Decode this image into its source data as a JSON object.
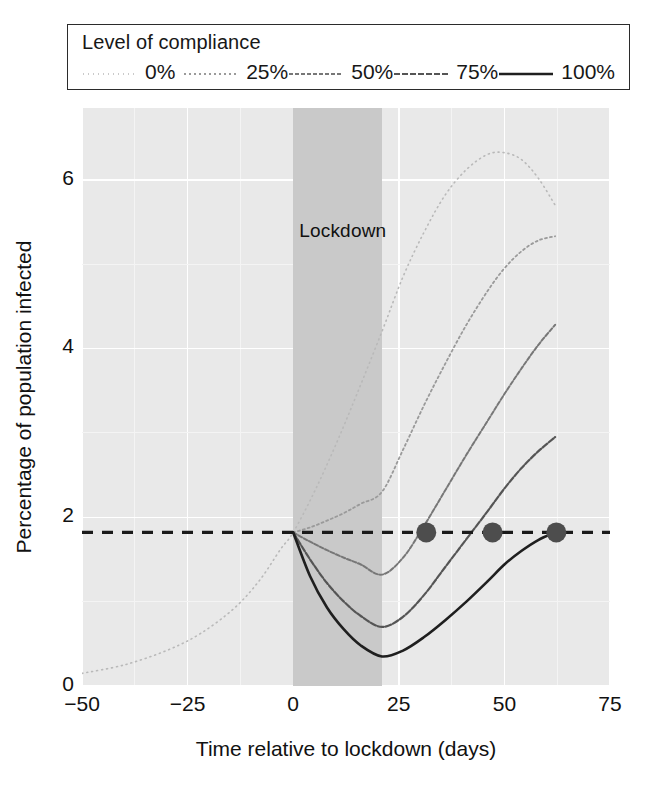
{
  "legend": {
    "title": "Level of compliance",
    "items": [
      {
        "label": "0%",
        "style": "dotted-light",
        "color": "#b9b9b9",
        "dash": "1,4",
        "width": 1.6
      },
      {
        "label": "25%",
        "style": "dotted",
        "color": "#9a9a9a",
        "dash": "2,3",
        "width": 1.8
      },
      {
        "label": "50%",
        "style": "dashed-fine",
        "color": "#777777",
        "dash": "4,2",
        "width": 2.0
      },
      {
        "label": "75%",
        "style": "dashed",
        "color": "#555555",
        "dash": "6,2",
        "width": 2.2
      },
      {
        "label": "100%",
        "style": "solid",
        "color": "#1f1f1f",
        "dash": "",
        "width": 2.6
      }
    ]
  },
  "annotations": {
    "lockdown_label": "Lockdown",
    "lockdown_start": 0,
    "lockdown_end": 21,
    "threshold_value": 1.82,
    "threshold_style": "dashed",
    "threshold_color": "#1a1a1a",
    "marker_color": "#4d4d4d",
    "markers": [
      {
        "x": 31.5,
        "y": 1.82
      },
      {
        "x": 47.2,
        "y": 1.82
      },
      {
        "x": 62.3,
        "y": 1.82
      }
    ]
  },
  "colors": {
    "panel": "#e9e9e9",
    "gridline_major": "#ffffff",
    "gridline_minor": "#f4f4f4",
    "lockdown_band": "#c9c9c9",
    "text": "#111111",
    "legend_border": "#2b2b2b"
  },
  "chart_data": {
    "type": "line",
    "title": "",
    "xlabel": "Time relative to lockdown (days)",
    "ylabel": "Percentage of population infected",
    "xlim": [
      -50,
      75
    ],
    "ylim": [
      0,
      6.85
    ],
    "xticks": [
      -50,
      -25,
      0,
      25,
      50,
      75
    ],
    "xtick_labels": [
      "−50",
      "−25",
      "0",
      "25",
      "50",
      "75"
    ],
    "yticks": [
      0,
      2,
      4,
      6
    ],
    "ytick_labels": [
      "0",
      "2",
      "4",
      "6"
    ],
    "grid": true,
    "legend_position": "above-plot",
    "shaded_regions": [
      {
        "label": "Lockdown",
        "x0": 0,
        "x1": 21,
        "color": "#c9c9c9"
      }
    ],
    "reference_lines": [
      {
        "orientation": "horizontal",
        "value": 1.82,
        "style": "dashed",
        "color": "#1a1a1a"
      }
    ],
    "series": [
      {
        "name": "0%",
        "x": [
          -50,
          -40,
          -30,
          -22,
          -14,
          -8,
          -3,
          0,
          5,
          10,
          15,
          21,
          26,
          31,
          36,
          41,
          46,
          50,
          54,
          58,
          62
        ],
        "values": [
          0.15,
          0.25,
          0.42,
          0.62,
          0.92,
          1.25,
          1.62,
          1.82,
          2.3,
          2.85,
          3.45,
          4.2,
          4.85,
          5.38,
          5.82,
          6.12,
          6.3,
          6.32,
          6.24,
          6.02,
          5.7
        ]
      },
      {
        "name": "25%",
        "x": [
          0,
          4,
          8,
          12,
          16,
          21,
          26,
          31,
          36,
          41,
          46,
          50,
          54,
          58,
          62
        ],
        "values": [
          1.82,
          1.88,
          1.96,
          2.05,
          2.16,
          2.3,
          2.8,
          3.33,
          3.82,
          4.28,
          4.68,
          4.95,
          5.15,
          5.28,
          5.33
        ]
      },
      {
        "name": "50%",
        "x": [
          0,
          4,
          8,
          12,
          16,
          21,
          26,
          31,
          36,
          41,
          46,
          50,
          54,
          58,
          62
        ],
        "values": [
          1.82,
          1.71,
          1.61,
          1.52,
          1.44,
          1.32,
          1.52,
          1.9,
          2.32,
          2.74,
          3.14,
          3.46,
          3.76,
          4.04,
          4.28
        ]
      },
      {
        "name": "75%",
        "x": [
          0,
          4,
          8,
          12,
          16,
          21,
          26,
          31,
          36,
          41,
          46,
          50,
          54,
          58,
          62
        ],
        "values": [
          1.82,
          1.5,
          1.22,
          1.0,
          0.83,
          0.7,
          0.82,
          1.08,
          1.41,
          1.74,
          2.07,
          2.34,
          2.58,
          2.78,
          2.95
        ]
      },
      {
        "name": "100%",
        "x": [
          0,
          4,
          8,
          12,
          16,
          21,
          26,
          31,
          36,
          41,
          46,
          50,
          54,
          58,
          62
        ],
        "values": [
          1.82,
          1.3,
          0.93,
          0.67,
          0.48,
          0.35,
          0.42,
          0.58,
          0.78,
          1.0,
          1.24,
          1.44,
          1.6,
          1.73,
          1.82
        ]
      }
    ]
  }
}
